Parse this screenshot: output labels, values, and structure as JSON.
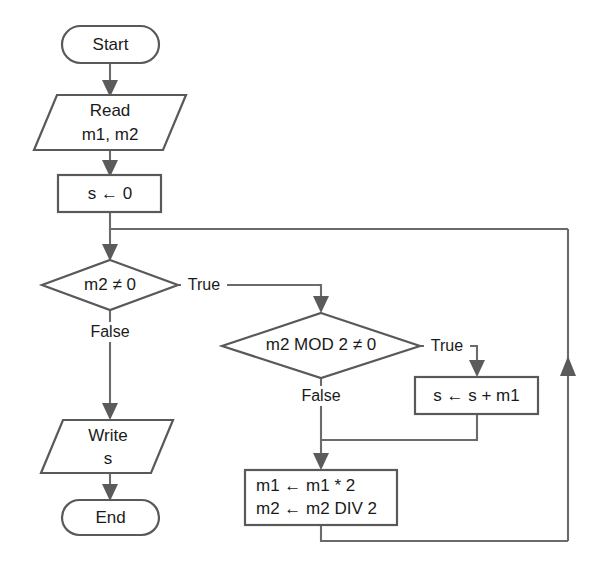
{
  "diagram": {
    "type": "flowchart",
    "colors": {
      "background": "#ffffff",
      "shape_stroke": "#595959",
      "edge_stroke": "#6b6b6b",
      "text": "#1a1a1a",
      "arrowhead": "#5b5b5b"
    },
    "nodes": {
      "start": {
        "shape": "terminal",
        "label": "Start"
      },
      "read": {
        "shape": "parallelogram-io",
        "line1": "Read",
        "line2": "m1, m2"
      },
      "init_sum": {
        "shape": "process",
        "label": "s ← 0"
      },
      "loop_condition": {
        "shape": "decision",
        "label": "m2 ≠ 0"
      },
      "odd_condition": {
        "shape": "decision",
        "label": "m2 MOD 2 ≠ 0"
      },
      "accumulate": {
        "shape": "process",
        "label": "s ← s + m1"
      },
      "halve_double": {
        "shape": "process",
        "line1": "m1 ← m1 * 2",
        "line2": "m2 ← m2 DIV 2"
      },
      "write": {
        "shape": "parallelogram-io",
        "line1": "Write",
        "line2": "s"
      },
      "end": {
        "shape": "terminal",
        "label": "End"
      }
    },
    "edge_labels": {
      "loop_true": "True",
      "loop_false": "False",
      "odd_true": "True",
      "odd_false": "False"
    }
  }
}
